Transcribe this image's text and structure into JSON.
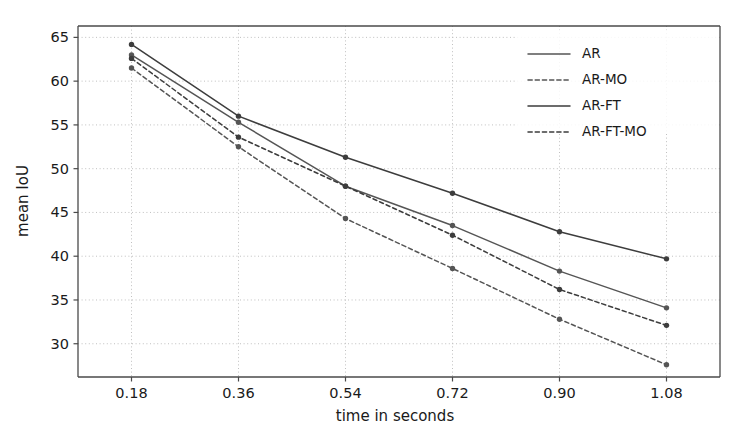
{
  "chart_data": {
    "type": "line",
    "title": "",
    "xlabel": "time in seconds",
    "ylabel": "mean IoU",
    "x": [
      0.18,
      0.36,
      0.54,
      0.72,
      0.9,
      1.08
    ],
    "xtick_labels": [
      "0.18",
      "0.36",
      "0.54",
      "0.72",
      "0.90",
      "1.08"
    ],
    "ytick_labels": [
      "30",
      "35",
      "40",
      "45",
      "50",
      "55",
      "60",
      "65"
    ],
    "yticks": [
      30,
      35,
      40,
      45,
      50,
      55,
      60,
      65
    ],
    "xlim": [
      0.09,
      1.17
    ],
    "ylim": [
      26.2,
      66.3
    ],
    "grid": true,
    "legend_position": "upper right",
    "series": [
      {
        "name": "AR",
        "style": "solid",
        "color": "#555555",
        "values": [
          63.0,
          55.3,
          48.0,
          43.5,
          38.3,
          34.1
        ]
      },
      {
        "name": "AR-MO",
        "style": "dashed",
        "color": "#555555",
        "values": [
          61.5,
          52.5,
          44.3,
          38.6,
          32.8,
          27.6
        ]
      },
      {
        "name": "AR-FT",
        "style": "solid",
        "color": "#3d3d3d",
        "values": [
          64.2,
          56.0,
          51.3,
          47.2,
          42.8,
          39.7
        ]
      },
      {
        "name": "AR-FT-MO",
        "style": "dashed",
        "color": "#3d3d3d",
        "values": [
          62.6,
          53.6,
          48.0,
          42.4,
          36.2,
          32.1
        ]
      }
    ]
  },
  "legend": {
    "entries": [
      {
        "label": "AR"
      },
      {
        "label": "AR-MO"
      },
      {
        "label": "AR-FT"
      },
      {
        "label": "AR-FT-MO"
      }
    ]
  },
  "colors": {
    "axis": "#4a4a4a",
    "grid": "#b9b9b9",
    "background": "#ffffff",
    "text": "#1a1a1a"
  }
}
